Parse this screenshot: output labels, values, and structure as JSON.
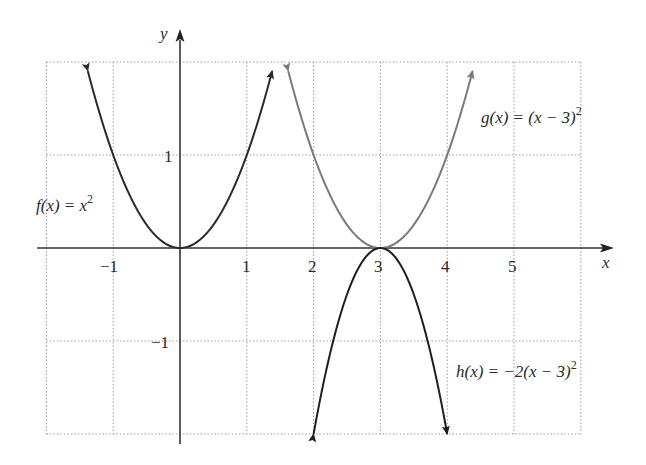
{
  "chart_data": {
    "type": "line",
    "title": "",
    "xlabel": "x",
    "ylabel": "y",
    "xlim": [
      -2,
      6
    ],
    "ylim": [
      -2,
      2
    ],
    "grid": true,
    "grid_style": "dotted",
    "x_ticks": [
      -1,
      1,
      2,
      3,
      4,
      5
    ],
    "x_tick_labels": [
      "−1",
      "1",
      "2",
      "3",
      "4",
      "5"
    ],
    "y_ticks": [
      1,
      -1
    ],
    "y_tick_labels": [
      "1",
      "−1"
    ],
    "series": [
      {
        "name": "f(x) = x^2",
        "label": "f(x) = x",
        "label_sup": "2",
        "formula": "x^2",
        "x_range": [
          -1.38,
          1.38
        ],
        "color": "#2b2b2b",
        "vertex": [
          0,
          0
        ]
      },
      {
        "name": "g(x) = (x − 3)^2",
        "label": "g(x) = (x − 3)",
        "label_sup": "2",
        "formula": "(x-3)^2",
        "x_range": [
          1.62,
          4.38
        ],
        "color": "#7a7a7a",
        "vertex": [
          3,
          0
        ]
      },
      {
        "name": "h(x) = −2(x − 3)^2",
        "label": "h(x) = −2(x − 3)",
        "label_sup": "2",
        "formula": "-2(x-3)^2",
        "x_range": [
          2,
          4
        ],
        "color": "#1e1e1e",
        "vertex": [
          3,
          0
        ]
      }
    ],
    "legend": "inline labels"
  },
  "labels": {
    "x_axis": "x",
    "y_axis": "y",
    "f": {
      "main": "f(x) = x",
      "sup": "2"
    },
    "g": {
      "main": "g(x) = (x − 3)",
      "sup": "2"
    },
    "h": {
      "main": "h(x) = −2(x − 3)",
      "sup": "2"
    }
  },
  "ticks": {
    "x": [
      "−1",
      "1",
      "2",
      "3",
      "4",
      "5"
    ],
    "y": [
      "1",
      "−1"
    ]
  }
}
